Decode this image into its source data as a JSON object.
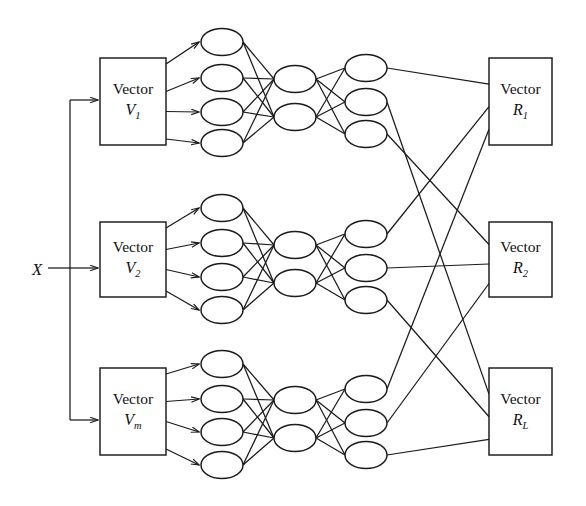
{
  "figure": {
    "type": "neural-network-diagram",
    "background_color": "#ffffff",
    "stroke_color": "#1a1a1a"
  },
  "input": {
    "label": "X",
    "x": 32,
    "y": 260
  },
  "vector_boxes": [
    {
      "name": "vector-box-v1",
      "line1": "Vector",
      "symbol": "V",
      "subscript": "1",
      "x": 100,
      "y": 58,
      "w": 66,
      "h": 87
    },
    {
      "name": "vector-box-v2",
      "line1": "Vector",
      "symbol": "V",
      "subscript": "2",
      "x": 100,
      "y": 222,
      "w": 66,
      "h": 75
    },
    {
      "name": "vector-box-vm",
      "line1": "Vector",
      "symbol": "V",
      "subscript": "m",
      "x": 100,
      "y": 368,
      "w": 66,
      "h": 87
    }
  ],
  "result_boxes": [
    {
      "name": "result-box-r1",
      "line1": "Vector",
      "symbol": "R",
      "subscript": "1",
      "x": 489,
      "y": 58,
      "w": 63,
      "h": 87
    },
    {
      "name": "result-box-r2",
      "line1": "Vector",
      "symbol": "R",
      "subscript": "2",
      "x": 489,
      "y": 222,
      "w": 63,
      "h": 75
    },
    {
      "name": "result-box-rl",
      "line1": "Vector",
      "symbol": "R",
      "subscript": "L",
      "x": 489,
      "y": 368,
      "w": 63,
      "h": 87
    }
  ],
  "blocks": [
    {
      "name": "network-block-1",
      "input_nodes": [
        {
          "cx": 222,
          "cy": 42
        },
        {
          "cx": 222,
          "cy": 78
        },
        {
          "cx": 222,
          "cy": 112
        },
        {
          "cx": 222,
          "cy": 143
        }
      ],
      "hidden_nodes": [
        {
          "cx": 295,
          "cy": 79
        },
        {
          "cx": 295,
          "cy": 117
        }
      ],
      "output_nodes": [
        {
          "cx": 366,
          "cy": 68
        },
        {
          "cx": 366,
          "cy": 102
        },
        {
          "cx": 366,
          "cy": 134
        }
      ]
    },
    {
      "name": "network-block-2",
      "input_nodes": [
        {
          "cx": 222,
          "cy": 208
        },
        {
          "cx": 222,
          "cy": 243
        },
        {
          "cx": 222,
          "cy": 277
        },
        {
          "cx": 222,
          "cy": 310
        }
      ],
      "hidden_nodes": [
        {
          "cx": 295,
          "cy": 245
        },
        {
          "cx": 295,
          "cy": 283
        }
      ],
      "output_nodes": [
        {
          "cx": 366,
          "cy": 234
        },
        {
          "cx": 366,
          "cy": 268
        },
        {
          "cx": 366,
          "cy": 300
        }
      ]
    },
    {
      "name": "network-block-3",
      "input_nodes": [
        {
          "cx": 222,
          "cy": 364
        },
        {
          "cx": 222,
          "cy": 399
        },
        {
          "cx": 222,
          "cy": 432
        },
        {
          "cx": 222,
          "cy": 465
        }
      ],
      "hidden_nodes": [
        {
          "cx": 295,
          "cy": 400
        },
        {
          "cx": 295,
          "cy": 438
        }
      ],
      "output_nodes": [
        {
          "cx": 366,
          "cy": 389
        },
        {
          "cx": 366,
          "cy": 423
        },
        {
          "cx": 366,
          "cy": 455
        }
      ]
    }
  ],
  "node_shape": {
    "rx": 21,
    "ry": 13.5
  },
  "bus": {
    "x": 70,
    "top_y": 100,
    "bottom_y": 420,
    "entry_y": 268
  },
  "output_connections": [
    {
      "from_block": 1,
      "from_node": 0,
      "to_box": "result-box-r1"
    },
    {
      "from_block": 1,
      "from_node": 1,
      "to_box": "result-box-rl"
    },
    {
      "from_block": 1,
      "from_node": 2,
      "to_box": "result-box-r2"
    },
    {
      "from_block": 2,
      "from_node": 0,
      "to_box": "result-box-r1"
    },
    {
      "from_block": 2,
      "from_node": 1,
      "to_box": "result-box-r2"
    },
    {
      "from_block": 2,
      "from_node": 2,
      "to_box": "result-box-rl"
    },
    {
      "from_block": 3,
      "from_node": 0,
      "to_box": "result-box-r1"
    },
    {
      "from_block": 3,
      "from_node": 1,
      "to_box": "result-box-r2"
    },
    {
      "from_block": 3,
      "from_node": 2,
      "to_box": "result-box-rl"
    }
  ]
}
